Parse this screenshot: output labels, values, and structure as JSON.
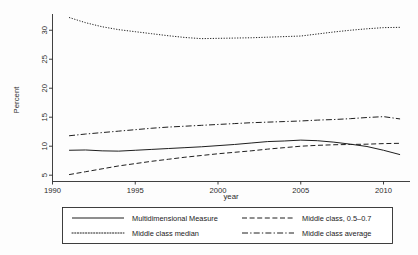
{
  "chart_data": {
    "type": "line",
    "title": "",
    "xlabel": "year",
    "ylabel": "Percent",
    "xlim": [
      1990,
      2011.6
    ],
    "ylim": [
      4.0,
      32.8
    ],
    "xticks": [
      1990,
      1995,
      2000,
      2005,
      2010
    ],
    "xtick_labels": [
      "1990",
      "1995",
      "2000",
      "2005",
      "2010"
    ],
    "yticks": [
      5,
      10,
      15,
      20,
      25,
      30
    ],
    "ytick_labels": [
      "5",
      "10",
      "15",
      "20",
      "25",
      "30"
    ],
    "grid": false,
    "legend_position": "below-axes",
    "x": [
      1991,
      1992,
      1993,
      1994,
      1995,
      1996,
      1997,
      1998,
      1999,
      2000,
      2001,
      2002,
      2003,
      2004,
      2005,
      2006,
      2007,
      2008,
      2009,
      2010,
      2011
    ],
    "series": [
      {
        "name": "Multidimensional Measure",
        "style": "solid",
        "values": [
          9.3,
          9.35,
          9.2,
          9.15,
          9.3,
          9.45,
          9.6,
          9.75,
          9.9,
          10.1,
          10.3,
          10.55,
          10.8,
          10.9,
          11.05,
          10.95,
          10.7,
          10.35,
          9.95,
          9.3,
          8.55
        ]
      },
      {
        "name": "Middle class median",
        "style": "dotted",
        "values": [
          32.2,
          31.3,
          30.6,
          30.1,
          29.75,
          29.4,
          29.05,
          28.75,
          28.55,
          28.6,
          28.65,
          28.7,
          28.8,
          28.9,
          29.0,
          29.35,
          29.7,
          30.0,
          30.25,
          30.45,
          30.5
        ]
      },
      {
        "name": "Middle class, 0.5–0.7",
        "style": "dashed",
        "values": [
          5.1,
          5.6,
          6.1,
          6.6,
          7.0,
          7.4,
          7.75,
          8.1,
          8.4,
          8.7,
          8.95,
          9.2,
          9.5,
          9.75,
          10.0,
          10.15,
          10.25,
          10.3,
          10.35,
          10.45,
          10.5
        ]
      },
      {
        "name": "Middle class average",
        "style": "dashdot",
        "values": [
          11.8,
          12.1,
          12.35,
          12.6,
          12.85,
          13.1,
          13.3,
          13.45,
          13.6,
          13.75,
          13.9,
          14.05,
          14.15,
          14.25,
          14.35,
          14.5,
          14.6,
          14.75,
          14.95,
          15.1,
          14.7
        ]
      }
    ]
  },
  "legend": {
    "entries": [
      {
        "label": "Multidimensional Measure",
        "style": "solid"
      },
      {
        "label": "Middle class median",
        "style": "dotted"
      },
      {
        "label": "Middle class, 0.5–0.7",
        "style": "dashed"
      },
      {
        "label": "Middle class average",
        "style": "dashdot"
      }
    ]
  },
  "colors": {
    "ink": "#1f1f1f",
    "axis": "#2b2b2b",
    "background": "#fdfdfd"
  }
}
